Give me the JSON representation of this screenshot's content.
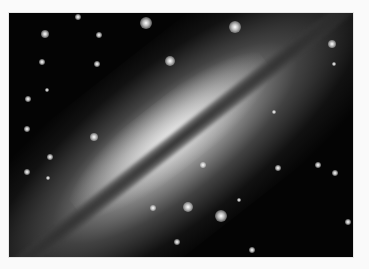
{
  "image": {
    "subject": "edge-on spiral galaxy with dark dust lane",
    "background_color": "#040404",
    "frame_color": "#fafafa",
    "galaxy_angle_deg": -38
  },
  "stars": [
    {
      "x": 146,
      "y": 23,
      "r": 6
    },
    {
      "x": 235,
      "y": 27,
      "r": 6
    },
    {
      "x": 45,
      "y": 34,
      "r": 4
    },
    {
      "x": 78,
      "y": 17,
      "r": 3
    },
    {
      "x": 99,
      "y": 35,
      "r": 3
    },
    {
      "x": 42,
      "y": 62,
      "r": 3
    },
    {
      "x": 97,
      "y": 64,
      "r": 3
    },
    {
      "x": 170,
      "y": 61,
      "r": 5
    },
    {
      "x": 28,
      "y": 99,
      "r": 3
    },
    {
      "x": 47,
      "y": 90,
      "r": 2
    },
    {
      "x": 332,
      "y": 44,
      "r": 4
    },
    {
      "x": 334,
      "y": 64,
      "r": 2
    },
    {
      "x": 27,
      "y": 129,
      "r": 3
    },
    {
      "x": 50,
      "y": 157,
      "r": 3
    },
    {
      "x": 94,
      "y": 137,
      "r": 4
    },
    {
      "x": 48,
      "y": 178,
      "r": 2
    },
    {
      "x": 27,
      "y": 172,
      "r": 3
    },
    {
      "x": 153,
      "y": 208,
      "r": 3
    },
    {
      "x": 188,
      "y": 207,
      "r": 5
    },
    {
      "x": 221,
      "y": 216,
      "r": 6
    },
    {
      "x": 203,
      "y": 165,
      "r": 3
    },
    {
      "x": 278,
      "y": 168,
      "r": 3
    },
    {
      "x": 318,
      "y": 165,
      "r": 3
    },
    {
      "x": 239,
      "y": 200,
      "r": 2
    },
    {
      "x": 177,
      "y": 242,
      "r": 3
    },
    {
      "x": 252,
      "y": 250,
      "r": 3
    },
    {
      "x": 348,
      "y": 222,
      "r": 3
    },
    {
      "x": 274,
      "y": 112,
      "r": 2
    },
    {
      "x": 335,
      "y": 173,
      "r": 3
    }
  ]
}
